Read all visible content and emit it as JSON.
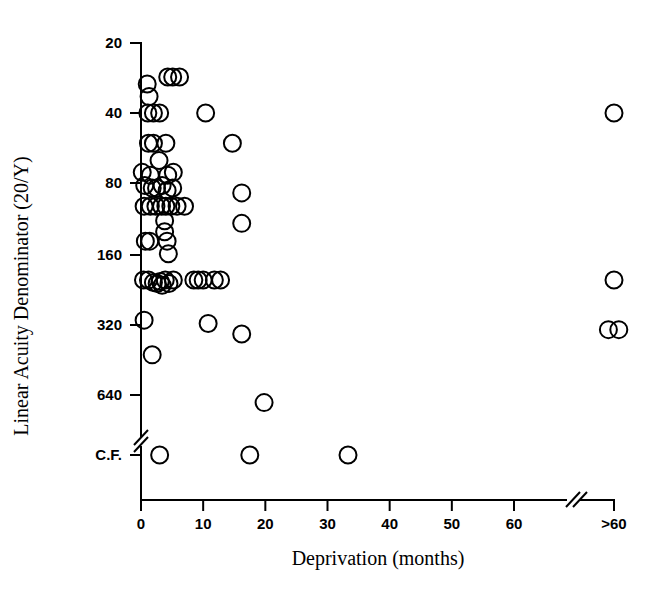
{
  "chart_data": {
    "type": "scatter",
    "title": "",
    "xlabel": "Deprivation (months)",
    "ylabel": "Linear Acuity Denominator (20/Y)",
    "grid": false,
    "legend": "none",
    "marker": "open-circle",
    "x_axis": {
      "tick_labels": [
        "0",
        "10",
        "20",
        "30",
        "40",
        "50",
        "60",
        ">60"
      ],
      "tick_values": [
        0,
        10,
        20,
        30,
        40,
        50,
        60,
        70
      ],
      "xlim": [
        0,
        70
      ],
      "axis_break": {
        "between": [
          60,
          ">60"
        ],
        "style": "double-slash"
      }
    },
    "y_axis": {
      "tick_labels": [
        "20",
        "40",
        "80",
        "160",
        "320",
        "640",
        "C.F."
      ],
      "tick_values": [
        20,
        40,
        80,
        160,
        320,
        640,
        1280
      ],
      "scale": "log2",
      "ylim_top": 20,
      "axis_break": {
        "between": [
          "640",
          "C.F."
        ],
        "style": "double-slash"
      }
    },
    "points": [
      {
        "x": 1.0,
        "y": 30
      },
      {
        "x": 1.3,
        "y": 34
      },
      {
        "x": 4.3,
        "y": 28
      },
      {
        "x": 5.1,
        "y": 28
      },
      {
        "x": 6.2,
        "y": 28
      },
      {
        "x": 1.1,
        "y": 40
      },
      {
        "x": 2.0,
        "y": 40
      },
      {
        "x": 3.0,
        "y": 40
      },
      {
        "x": 10.4,
        "y": 40
      },
      {
        "x": 70.0,
        "y": 40
      },
      {
        "x": 1.2,
        "y": 54
      },
      {
        "x": 2.0,
        "y": 54
      },
      {
        "x": 4.0,
        "y": 54
      },
      {
        "x": 14.7,
        "y": 54
      },
      {
        "x": 2.9,
        "y": 64
      },
      {
        "x": 0.2,
        "y": 72
      },
      {
        "x": 1.5,
        "y": 74
      },
      {
        "x": 4.3,
        "y": 74
      },
      {
        "x": 5.2,
        "y": 72
      },
      {
        "x": 0.6,
        "y": 82
      },
      {
        "x": 1.8,
        "y": 84
      },
      {
        "x": 2.5,
        "y": 84
      },
      {
        "x": 3.4,
        "y": 82
      },
      {
        "x": 4.2,
        "y": 86
      },
      {
        "x": 5.1,
        "y": 84
      },
      {
        "x": 16.2,
        "y": 88
      },
      {
        "x": 0.5,
        "y": 100
      },
      {
        "x": 1.5,
        "y": 100
      },
      {
        "x": 2.4,
        "y": 100
      },
      {
        "x": 3.3,
        "y": 100
      },
      {
        "x": 4.0,
        "y": 100
      },
      {
        "x": 4.8,
        "y": 100
      },
      {
        "x": 5.8,
        "y": 100
      },
      {
        "x": 7.0,
        "y": 100
      },
      {
        "x": 16.2,
        "y": 118
      },
      {
        "x": 3.8,
        "y": 115
      },
      {
        "x": 3.8,
        "y": 128
      },
      {
        "x": 0.7,
        "y": 140
      },
      {
        "x": 1.4,
        "y": 140
      },
      {
        "x": 4.2,
        "y": 140
      },
      {
        "x": 4.4,
        "y": 158
      },
      {
        "x": 0.4,
        "y": 205
      },
      {
        "x": 1.2,
        "y": 205
      },
      {
        "x": 2.0,
        "y": 210
      },
      {
        "x": 2.6,
        "y": 212
      },
      {
        "x": 3.1,
        "y": 208
      },
      {
        "x": 3.4,
        "y": 216
      },
      {
        "x": 3.9,
        "y": 205
      },
      {
        "x": 4.5,
        "y": 212
      },
      {
        "x": 5.2,
        "y": 205
      },
      {
        "x": 8.5,
        "y": 205
      },
      {
        "x": 9.2,
        "y": 205
      },
      {
        "x": 10.0,
        "y": 205
      },
      {
        "x": 11.8,
        "y": 205
      },
      {
        "x": 12.8,
        "y": 205
      },
      {
        "x": 70.0,
        "y": 205
      },
      {
        "x": 0.5,
        "y": 305
      },
      {
        "x": 10.8,
        "y": 315
      },
      {
        "x": 16.2,
        "y": 350
      },
      {
        "x": 69.3,
        "y": 335
      },
      {
        "x": 70.6,
        "y": 335
      },
      {
        "x": 1.8,
        "y": 430
      },
      {
        "x": 19.8,
        "y": 690
      },
      {
        "x": 3.0,
        "y": 1280
      },
      {
        "x": 17.5,
        "y": 1280
      },
      {
        "x": 33.3,
        "y": 1280
      }
    ],
    "point_count": 66
  }
}
